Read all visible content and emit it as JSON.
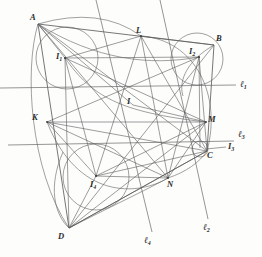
{
  "figure": {
    "type": "geometry-diagram",
    "colors": {
      "background": "#fdfdfc",
      "stroke": "#5b5b5b",
      "label": "#2b2b2b"
    }
  },
  "labels": {
    "vertices": [
      {
        "name": "A",
        "text": "A",
        "sub": "",
        "x": 30,
        "y": 13
      },
      {
        "name": "B",
        "text": "B",
        "sub": "",
        "x": 216,
        "y": 34
      },
      {
        "name": "C",
        "text": "C",
        "sub": "",
        "x": 207,
        "y": 151
      },
      {
        "name": "D",
        "text": "D",
        "sub": "",
        "x": 58,
        "y": 232
      }
    ],
    "incenters": [
      {
        "name": "I1",
        "text": "I",
        "sub": "1",
        "x": 56,
        "y": 52
      },
      {
        "name": "I2",
        "text": "I",
        "sub": "2",
        "x": 189,
        "y": 47
      },
      {
        "name": "I3",
        "text": "I",
        "sub": "3",
        "x": 228,
        "y": 142
      },
      {
        "name": "I4",
        "text": "I",
        "sub": "4",
        "x": 90,
        "y": 180
      }
    ],
    "points": [
      {
        "name": "K",
        "text": "K",
        "sub": "",
        "x": 32,
        "y": 113
      },
      {
        "name": "L",
        "text": "L",
        "sub": "",
        "x": 136,
        "y": 26
      },
      {
        "name": "M",
        "text": "M",
        "sub": "",
        "x": 208,
        "y": 115
      },
      {
        "name": "N",
        "text": "N",
        "sub": "",
        "x": 167,
        "y": 180
      },
      {
        "name": "I",
        "text": "I",
        "sub": "",
        "x": 127,
        "y": 97
      }
    ],
    "lines": [
      {
        "name": "l1",
        "text": "ℓ",
        "sub": "1",
        "x": 240,
        "y": 80
      },
      {
        "name": "l2",
        "text": "ℓ",
        "sub": "2",
        "x": 203,
        "y": 223
      },
      {
        "name": "l3",
        "text": "ℓ",
        "sub": "3",
        "x": 238,
        "y": 130
      },
      {
        "name": "l4",
        "text": "ℓ",
        "sub": "4",
        "x": 144,
        "y": 236
      }
    ]
  },
  "geometry": {
    "vertices": {
      "A": [
        38,
        24
      ],
      "B": [
        214,
        45
      ],
      "C": [
        207,
        151
      ],
      "D": [
        69,
        228
      ]
    },
    "incenters": {
      "I1": [
        65,
        58
      ],
      "I2": [
        199,
        57
      ],
      "I3": [
        200,
        148
      ],
      "I4": [
        96,
        176
      ]
    },
    "touch_points": {
      "K": [
        47,
        122
      ],
      "L": [
        141,
        36
      ],
      "M": [
        206,
        122
      ],
      "N": [
        168,
        178
      ],
      "I": [
        133,
        105
      ]
    },
    "circles": [
      {
        "name": "incircle-1",
        "cx": 67,
        "cy": 58,
        "r": 31
      },
      {
        "name": "incircle-2",
        "cx": 197,
        "cy": 59,
        "r": 26
      },
      {
        "name": "incircle-3",
        "cx": 200,
        "cy": 149,
        "r": 8
      },
      {
        "name": "incircle-4",
        "cx": 96,
        "cy": 177,
        "r": 33
      }
    ],
    "axis_lines": [
      {
        "name": "l1",
        "x1": 0,
        "y1": 88,
        "x2": 236,
        "y2": 85
      },
      {
        "name": "l3",
        "x1": 8,
        "y1": 145,
        "x2": 234,
        "y2": 141
      }
    ],
    "diagonal_lines": [
      {
        "name": "l2",
        "x1": 160,
        "y1": 0,
        "x2": 208,
        "y2": 219
      },
      {
        "name": "l4",
        "x1": 96,
        "y1": 0,
        "x2": 152,
        "y2": 232
      }
    ]
  }
}
